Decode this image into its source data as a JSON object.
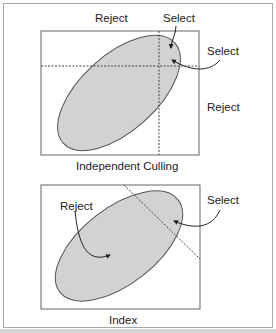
{
  "panels": [
    {
      "caption": "Independent Culling",
      "labels": {
        "top_left": "Reject",
        "top_right": "Select",
        "right_upper": "Select",
        "right_lower": "Reject"
      }
    },
    {
      "caption": "Index",
      "labels": {
        "left": "Reject",
        "right": "Select"
      }
    }
  ],
  "colors": {
    "ellipse_fill": "#d2d2d2",
    "ellipse_stroke": "#555555",
    "box_stroke": "#666666",
    "dashed_line": "#444444",
    "frame": "#a8a8a8"
  }
}
